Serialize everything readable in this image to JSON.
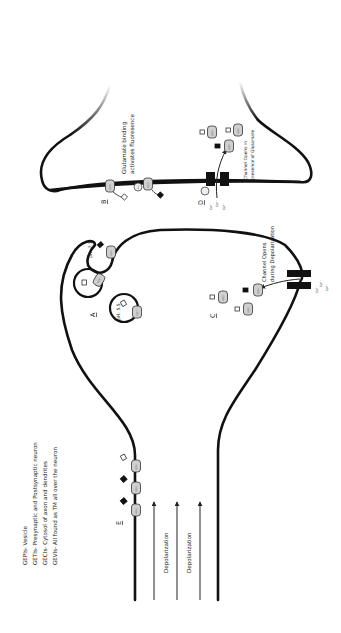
{
  "legend": {
    "lines": [
      "GEPIs- Vesicle",
      "GETIs- Presynaptic and Postsynaptic neuron",
      "GECIs- Cytosol of axon and dendrites",
      "GEVIs- All found as TM all over the neuron"
    ]
  },
  "labels": {
    "A": "A",
    "B": "B",
    "C": "C",
    "D": "D",
    "E": "E"
  },
  "annotations": {
    "glutamate_line1": "Glutamate binding",
    "glutamate_line2": "activates fluoresence",
    "post_channel_line1": "Channel Opens in",
    "post_channel_line2": "presence of Glutamate",
    "pre_channel_line1": "Channel Opens",
    "pre_channel_line2": "during Depolarization",
    "ph_docked": "pH: 7.1",
    "ph_vesicle": "pH: 5.5",
    "depolarization_1": "Depolarization",
    "depolarization_2": "Depolarization",
    "ca": "Ca²⁺",
    "glu": "Glu"
  },
  "sensor_labels": {
    "gepi": "GEPI",
    "geti": "GETI",
    "geci": "GECI",
    "gevi": "GEVI"
  },
  "colors": {
    "membrane": "#111111",
    "sensor_fill": "#cfcfcf",
    "channel": "#111111",
    "background": "#ffffff"
  }
}
